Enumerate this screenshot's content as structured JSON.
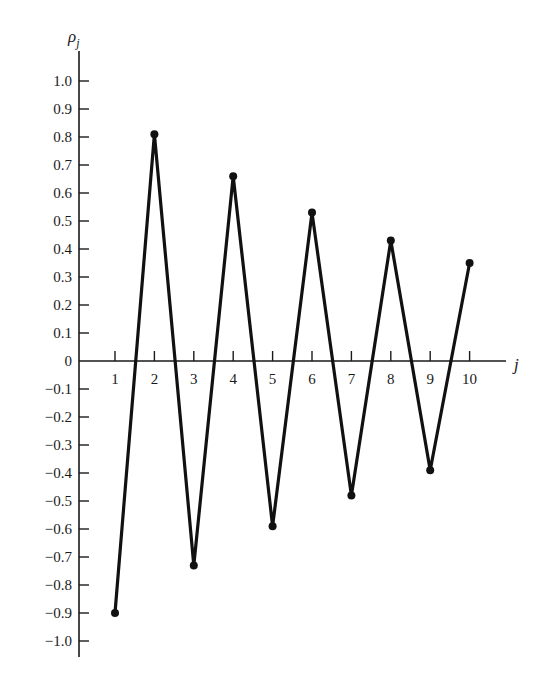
{
  "chart_data": {
    "type": "line",
    "title": "",
    "xlabel": "j",
    "ylabel": "ρ_j",
    "ylabel_main": "ρ",
    "ylabel_sub": "j",
    "x": [
      1,
      2,
      3,
      4,
      5,
      6,
      7,
      8,
      9,
      10
    ],
    "values": [
      -0.9,
      0.81,
      -0.73,
      0.66,
      -0.59,
      0.53,
      -0.48,
      0.43,
      -0.39,
      0.35
    ],
    "x_ticks": [
      "1",
      "2",
      "3",
      "4",
      "5",
      "6",
      "7",
      "8",
      "9",
      "10"
    ],
    "y_ticks": [
      "1.0",
      "0.9",
      "0.8",
      "0.7",
      "0.6",
      "0.5",
      "0.4",
      "0.3",
      "0.2",
      "0.1",
      "0",
      "−0.1",
      "−0.2",
      "−0.3",
      "−0.4",
      "−0.5",
      "−0.6",
      "−0.7",
      "−0.8",
      "−0.9",
      "−1.0"
    ],
    "y_tick_values": [
      1.0,
      0.9,
      0.8,
      0.7,
      0.6,
      0.5,
      0.4,
      0.3,
      0.2,
      0.1,
      0,
      -0.1,
      -0.2,
      -0.3,
      -0.4,
      -0.5,
      -0.6,
      -0.7,
      -0.8,
      -0.9,
      -1.0
    ],
    "ylim": [
      -1.0,
      1.0
    ],
    "xlim": [
      0,
      10.9
    ],
    "grid": false,
    "legend": null,
    "markers": true,
    "line_color": "#111111"
  }
}
